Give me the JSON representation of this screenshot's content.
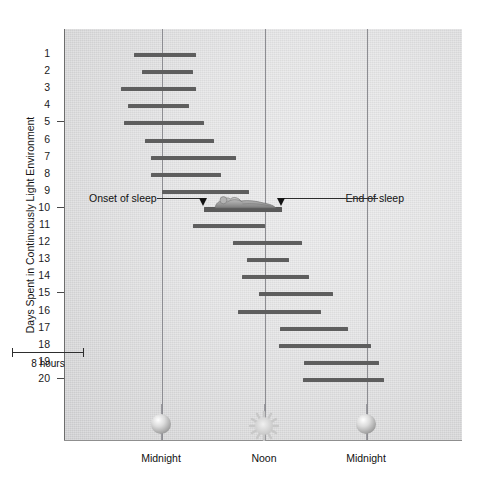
{
  "chart_data": {
    "type": "bar",
    "title": "",
    "subtitle": "",
    "ylabel": "Days Spent in Continuously Light Environment",
    "xlabel": "",
    "x_tick_labels": [
      "Midnight",
      "Noon",
      "Midnight"
    ],
    "x_tick_hours": [
      0,
      12,
      24
    ],
    "xlim": [
      -6.2,
      26.6
    ],
    "ylim": [
      0,
      21
    ],
    "grid": "vertical-only",
    "legend": "none",
    "orientation": "horizontal",
    "bar_color": "#5e5e5e",
    "background_color": "#e4e4e5",
    "gridline_color": "#8d8d92",
    "scale_bar_label": "8 hours",
    "scale_bar_hours": 8,
    "y_tick_values": [
      5,
      10,
      15,
      20
    ],
    "categories": [
      "1",
      "2",
      "3",
      "4",
      "5",
      "6",
      "7",
      "8",
      "9",
      "10",
      "11",
      "12",
      "13",
      "14",
      "15",
      "16",
      "17",
      "18",
      "19",
      "20"
    ],
    "series": [
      {
        "name": "Sleep period",
        "units": "hours from midnight",
        "bars": [
          {
            "day": 1,
            "start": -3.3,
            "end": 4.0
          },
          {
            "day": 2,
            "start": -2.3,
            "end": 3.6
          },
          {
            "day": 3,
            "start": -4.8,
            "end": 4.0
          },
          {
            "day": 4,
            "start": -4.0,
            "end": 3.2
          },
          {
            "day": 5,
            "start": -4.4,
            "end": 4.9
          },
          {
            "day": 6,
            "start": -2.0,
            "end": 6.1
          },
          {
            "day": 7,
            "start": -1.3,
            "end": 8.7
          },
          {
            "day": 8,
            "start": -1.3,
            "end": 6.9
          },
          {
            "day": 9,
            "start": 0.0,
            "end": 10.2
          },
          {
            "day": 10,
            "start": 4.9,
            "end": 14.0
          },
          {
            "day": 11,
            "start": 3.6,
            "end": 12.0
          },
          {
            "day": 12,
            "start": 8.3,
            "end": 16.4
          },
          {
            "day": 13,
            "start": 9.9,
            "end": 14.9
          },
          {
            "day": 14,
            "start": 9.4,
            "end": 17.2
          },
          {
            "day": 15,
            "start": 11.3,
            "end": 20.0
          },
          {
            "day": 16,
            "start": 8.9,
            "end": 18.6
          },
          {
            "day": 17,
            "start": 13.8,
            "end": 21.8
          },
          {
            "day": 18,
            "start": 13.7,
            "end": 24.5
          },
          {
            "day": 19,
            "start": 16.6,
            "end": 25.4
          },
          {
            "day": 20,
            "start": 16.5,
            "end": 26.0
          }
        ]
      }
    ],
    "annotations": [
      {
        "name": "onset-of-sleep",
        "label": "Onset of sleep",
        "points_to_day": 10,
        "points_to_hour": 4.9,
        "side": "left"
      },
      {
        "name": "end-of-sleep",
        "label": "End of sleep",
        "points_to_day": 10,
        "points_to_hour": 14.0,
        "side": "right"
      }
    ],
    "illustration": {
      "name": "sleeping-person",
      "on_day": 10
    }
  },
  "axis": {
    "y_title": "Days Spent in Continuously Light Environment",
    "y_labels": [
      "1",
      "2",
      "3",
      "4",
      "5",
      "6",
      "7",
      "8",
      "9",
      "10",
      "11",
      "12",
      "13",
      "14",
      "15",
      "16",
      "17",
      "18",
      "19",
      "20"
    ],
    "x_labels": [
      {
        "text": "Midnight",
        "icon": "moon-icon"
      },
      {
        "text": "Noon",
        "icon": "sun-icon"
      },
      {
        "text": "Midnight",
        "icon": "moon-icon"
      }
    ]
  },
  "annotations": {
    "onset": "Onset of sleep",
    "end": "End of sleep"
  },
  "scale": {
    "label": "8 hours"
  },
  "colors": {
    "bar": "#5e5e5e",
    "gridline": "#8d8d92",
    "text": "#111111",
    "plot_bg": "#e4e4e5"
  }
}
